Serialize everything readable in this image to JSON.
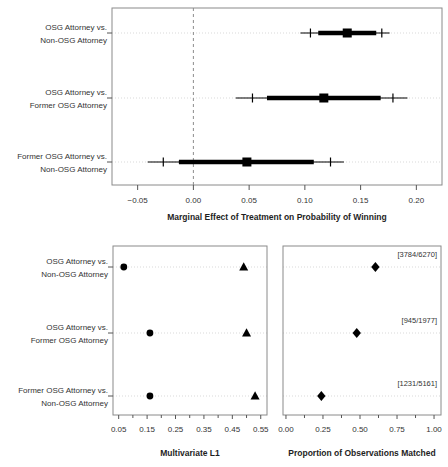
{
  "colors": {
    "marker": "#000000",
    "box_border": "#8a8a8a",
    "gridline": "#d9d9d9",
    "reference_line": "#8c8c8c",
    "tick": "#555555",
    "text": "#333333"
  },
  "chart_data": [
    {
      "id": "forest",
      "type": "forest-interval",
      "xlabel": "Marginal Effect of Treatment on Probability of Winning",
      "xlim": [
        -0.073,
        0.223
      ],
      "xtick_values": [
        -0.05,
        0.0,
        0.05,
        0.1,
        0.15,
        0.2
      ],
      "xticks": [
        "−0.05",
        "0.00",
        "0.05",
        "0.10",
        "0.15",
        "0.20"
      ],
      "reference_line_x": 0.0,
      "grid": "dotted-row-lines",
      "categories": [
        [
          "OSG Attorney vs.",
          "Non-OSG Attorney"
        ],
        [
          "OSG Attorney vs.",
          "Former OSG Attorney"
        ],
        [
          "Former OSG Attorney vs.",
          "Non-OSG Attorney"
        ]
      ],
      "rows": [
        {
          "estimate": 0.138,
          "thick_interval": [
            0.112,
            0.164
          ],
          "thin_interval": [
            0.096,
            0.176
          ],
          "cross_marks": [
            0.105,
            0.169
          ]
        },
        {
          "estimate": 0.117,
          "thick_interval": [
            0.066,
            0.168
          ],
          "thin_interval": [
            0.038,
            0.192
          ],
          "cross_marks": [
            0.053,
            0.179
          ]
        },
        {
          "estimate": 0.048,
          "thick_interval": [
            -0.013,
            0.108
          ],
          "thin_interval": [
            -0.041,
            0.135
          ],
          "cross_marks": [
            -0.027,
            0.123
          ]
        }
      ]
    },
    {
      "id": "l1",
      "type": "scatter",
      "xlabel": "Multivariate L1",
      "xlim": [
        0.03,
        0.572
      ],
      "xtick_values": [
        0.05,
        0.15,
        0.25,
        0.35,
        0.45,
        0.55
      ],
      "xticks": [
        "0.05",
        "0.15",
        "0.25",
        "0.35",
        "0.45",
        "0.55"
      ],
      "minor_tick_values": [
        0.1,
        0.2,
        0.3,
        0.4,
        0.5
      ],
      "grid": "dotted-row-lines",
      "categories": [
        [
          "OSG Attorney vs.",
          "Non-OSG Attorney"
        ],
        [
          "OSG Attorney vs.",
          "Former OSG Attorney"
        ],
        [
          "Former OSG Attorney vs.",
          "Non-OSG Attorney"
        ]
      ],
      "series": [
        {
          "name": "circle-marker",
          "marker": "circle",
          "values": [
            0.068,
            0.16,
            0.16
          ]
        },
        {
          "name": "triangle-marker",
          "marker": "triangle",
          "values": [
            0.49,
            0.5,
            0.53
          ]
        }
      ]
    },
    {
      "id": "matched",
      "type": "scatter",
      "xlabel": "Proportion of Observations Matched",
      "xlim": [
        -0.02,
        1.047
      ],
      "xtick_values": [
        0.0,
        0.25,
        0.5,
        0.75,
        1.0
      ],
      "xticks": [
        "0.00",
        "0.25",
        "0.50",
        "0.75",
        "1.00"
      ],
      "minor_tick_values": [
        0.125,
        0.375,
        0.625,
        0.875
      ],
      "grid": "dotted-row-lines",
      "series": [
        {
          "name": "diamond-marker",
          "marker": "diamond",
          "values": [
            0.604,
            0.478,
            0.239
          ]
        }
      ],
      "annotations": [
        "[3784/6270]",
        "[945/1977]",
        "[1231/5161]"
      ]
    }
  ]
}
